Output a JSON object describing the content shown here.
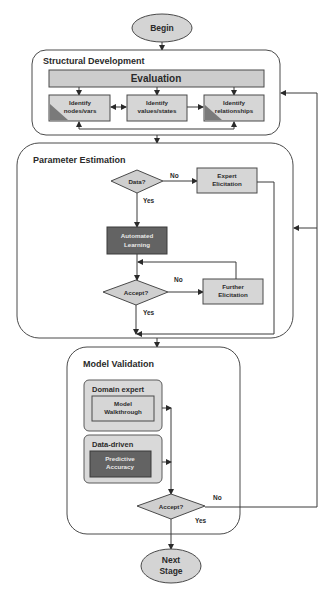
{
  "diagram": {
    "start": {
      "label": "Begin"
    },
    "end": {
      "label_line1": "Next",
      "label_line2": "Stage"
    },
    "structural": {
      "title": "Structural Development",
      "evaluation": "Evaluation",
      "nodes": [
        {
          "line1": "Identify",
          "line2": "nodes/vars"
        },
        {
          "line1": "Identify",
          "line2": "values/states"
        },
        {
          "line1": "Identify",
          "line2": "relationships"
        }
      ]
    },
    "parameter": {
      "title": "Parameter Estimation",
      "data_decision": "Data?",
      "no_label": "No",
      "yes_label": "Yes",
      "expert": {
        "line1": "Expert",
        "line2": "Elicitation"
      },
      "automated": {
        "line1": "Automated",
        "line2": "Learning"
      },
      "accept_decision": "Accept?",
      "accept_no": "No",
      "accept_yes": "Yes",
      "further": {
        "line1": "Further",
        "line2": "Elicitation"
      }
    },
    "validation": {
      "title": "Model Validation",
      "domain_expert": {
        "title": "Domain expert",
        "line1": "Model",
        "line2": "Walkthrough"
      },
      "data_driven": {
        "title": "Data-driven",
        "line1": "Predictive",
        "line2": "Accuracy"
      },
      "accept_decision": "Accept?",
      "no_label": "No",
      "yes_label": "Yes"
    },
    "colors": {
      "light_fill": "#d6d6d6",
      "dark_fill": "#636363",
      "stroke": "#4a4a4a"
    }
  }
}
